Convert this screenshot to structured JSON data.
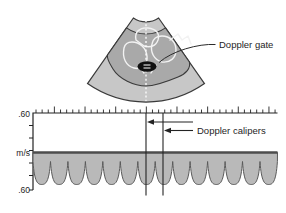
{
  "sonogram": {
    "label_doppler_gate": "Doppler gate",
    "gate_icon": "doppler-gate-sample-volume",
    "scanline_icon": "dotted-beam-line",
    "colors": {
      "sector_fill": "#c7c7c7",
      "tissue_fill": "#a9a9a9",
      "outline": "#3a3a3a",
      "chamber_outline": "#f2f2f2",
      "gate_fill": "#101010",
      "scanline": "#ffffff"
    }
  },
  "spectral": {
    "label_doppler_calipers": "Doppler calipers",
    "y_axis": {
      "top_label": ".60",
      "mid_label": "m/s",
      "bottom_label": ".60"
    },
    "plot": {
      "x0": 33,
      "x1": 277.5,
      "ruler_y": 113,
      "baseline_y": 152.5,
      "axis_bottom_y": 190,
      "minor_tick_step": 6.13,
      "major_every": 5,
      "y_ticks": [
        125.5,
        138,
        150.5,
        163,
        175.5,
        190
      ],
      "wave": {
        "period": 17.46,
        "cusp_y": 161.5,
        "dip_y": 184.5,
        "cycles": 14
      },
      "calipers": {
        "x1": 146,
        "x2": 163,
        "y_top": 113,
        "y_bottom": 195.5
      },
      "colors": {
        "band_fill": "#b9b9b9",
        "band_top": "#4d4d4d",
        "band_edge": "#5a5a5a",
        "axis": "#232323"
      }
    },
    "arrows": [
      {
        "y": 122,
        "x_tail": 193,
        "x_tip": 147
      },
      {
        "y": 130.5,
        "x_tail": 193,
        "x_tip": 164
      }
    ]
  }
}
